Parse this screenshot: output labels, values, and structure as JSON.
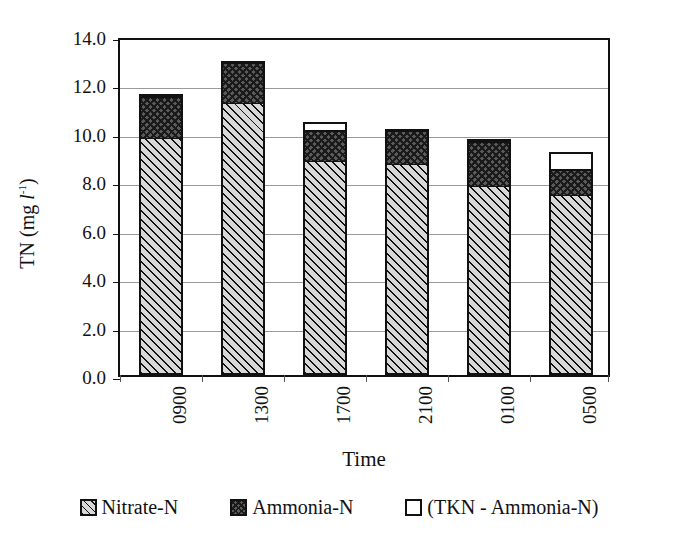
{
  "chart_data": {
    "type": "bar",
    "stacked": true,
    "title": "",
    "xlabel": "Time",
    "ylabel": "TN (mg l-1)",
    "ylabel_parts": {
      "prefix": "TN (mg ",
      "italic": "l",
      "sup": "-1",
      "suffix": ")"
    },
    "categories": [
      "0900",
      "1300",
      "1700",
      "2100",
      "0100",
      "0500"
    ],
    "series": [
      {
        "name": "Nitrate-N",
        "values": [
          9.65,
          11.1,
          8.7,
          8.6,
          7.7,
          7.3
        ]
      },
      {
        "name": "Ammonia-N",
        "values": [
          1.75,
          1.7,
          1.3,
          1.4,
          1.85,
          1.1
        ]
      },
      {
        "name": "(TKN - Ammonia-N)",
        "values": [
          0.05,
          0.0,
          0.3,
          0.0,
          0.05,
          0.65
        ]
      }
    ],
    "totals": [
      11.45,
      12.8,
      10.3,
      10.0,
      9.6,
      9.05
    ],
    "ylim": [
      0.0,
      14.0
    ],
    "ytick_values": [
      0.0,
      2.0,
      4.0,
      6.0,
      8.0,
      10.0,
      12.0,
      14.0
    ],
    "ytick_labels": [
      "0.0",
      "2.0",
      "4.0",
      "6.0",
      "8.0",
      "10.0",
      "12.0",
      "14.0"
    ],
    "grid": "horizontal",
    "legend_position": "bottom",
    "colors": {
      "nitrate": "#d8d8d8",
      "ammonia": "#5a5a5a",
      "tkn": "#ffffff",
      "axis": "#111111",
      "grid": "#9a9a9a"
    }
  },
  "legend": {
    "items": [
      {
        "label": "Nitrate-N",
        "swatch": "diagonal-hatch-swatch"
      },
      {
        "label": "Ammonia-N",
        "swatch": "crosshatch-dark-swatch"
      },
      {
        "label": "(TKN - Ammonia-N)",
        "swatch": "empty-white-swatch"
      }
    ]
  }
}
